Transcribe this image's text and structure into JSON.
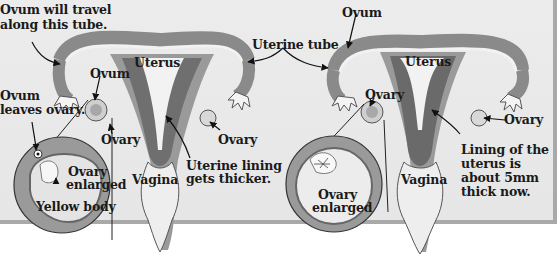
{
  "diagram": {
    "style": "grayscale",
    "colors": {
      "background": "#e8e8e8",
      "uterus_wall": "#8a8a8a",
      "lining": "#6f6f6f",
      "cavity": "#f2f2f2",
      "border": "#a9a9a9",
      "text": "#1a1a1a"
    },
    "left_panel": {
      "labels": {
        "ovum_travel": [
          "Ovum will travel",
          "along this tube."
        ],
        "uterus": "Uterus",
        "ovum": "Ovum",
        "ovum_leaves": [
          "Ovum",
          "leaves ovary."
        ],
        "ovary_left": "Ovary",
        "ovary_right": "Ovary",
        "ovary_enlarged": [
          "Ovary",
          "enlarged"
        ],
        "yellow_body": "Yellow body",
        "vagina": "Vagina",
        "uterine_lining": [
          "Uterine lining",
          "gets thicker."
        ]
      }
    },
    "shared": {
      "uterine_tube": "Uterine tube"
    },
    "right_panel": {
      "labels": {
        "ovum": "Ovum",
        "uterus": "Uterus",
        "ovary_left": "Ovary",
        "ovary_right": "Ovary",
        "ovary_enlarged": [
          "Ovary",
          "enlarged"
        ],
        "vagina": "Vagina",
        "lining": [
          "Lining of the",
          "uterus is",
          "about 5mm",
          "thick now."
        ]
      }
    }
  }
}
